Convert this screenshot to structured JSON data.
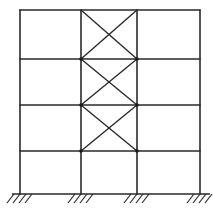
{
  "diagram": {
    "type": "braced-frame",
    "stroke_color": "#2a2a2a",
    "background": "#ffffff",
    "columns_x": [
      20,
      81,
      137,
      200
    ],
    "floors_y": [
      10,
      59,
      105,
      151,
      194
    ],
    "stories": 4,
    "bays": 3,
    "braced_bay_index": 1,
    "braced_stories": [
      0,
      1,
      2
    ],
    "ground": {
      "y": 194,
      "x_start": 12,
      "x_end": 210
    },
    "supports": [
      {
        "x": 20,
        "hatches": 4
      },
      {
        "x": 81,
        "hatches": 4
      },
      {
        "x": 137,
        "hatches": 4
      },
      {
        "x": 200,
        "hatches": 4
      }
    ]
  }
}
